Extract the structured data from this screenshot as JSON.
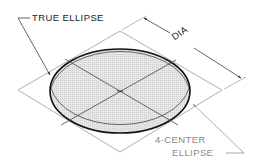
{
  "diagram": {
    "labels": {
      "true_ellipse": "TRUE ELLIPSE",
      "dimension": "DIA",
      "four_center_line1": "4-CENTER",
      "four_center_line2": "ELLIPSE"
    },
    "colors": {
      "background": "#ffffff",
      "ellipse_fill": "#e3e3e3",
      "true_ellipse_stroke": "#111111",
      "four_center_stroke": "#555555",
      "construction_lines": "#9a9a9a",
      "center_lines": "#444444",
      "label_dark": "#222222",
      "label_gray": "#8a8a8a"
    }
  }
}
